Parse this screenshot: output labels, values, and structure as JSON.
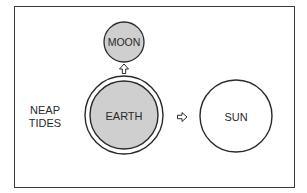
{
  "diagram": {
    "title": "NEAP TIDES",
    "label_lines": [
      "NEAP",
      "TIDES"
    ],
    "bodies": {
      "moon": {
        "label": "MOON",
        "fill": "#cfcfcf"
      },
      "earth": {
        "label": "EARTH",
        "fill": "#cfcfcf"
      },
      "sun": {
        "label": "SUN",
        "fill": "#ffffff"
      }
    },
    "arrows": [
      {
        "name": "earth-to-moon",
        "direction": "up",
        "glyph": "hollow-arrow-up"
      },
      {
        "name": "earth-to-sun",
        "direction": "right",
        "glyph": "hollow-arrow-right"
      }
    ],
    "colors": {
      "stroke": "#2a2a2a",
      "body_fill": "#cfcfcf",
      "background": "#ffffff"
    }
  }
}
